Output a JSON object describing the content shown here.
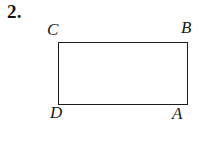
{
  "page": {
    "background_color": "#ffffff",
    "ink_color": "#1a1a1a",
    "width": 215,
    "height": 144
  },
  "problem": {
    "number_label": "2."
  },
  "figure": {
    "kind": "rectangle",
    "stroke_color": "#1c1c1c",
    "fill_color": "#ffffff",
    "stroke_width_px": 1.5,
    "left": 58,
    "top": 42,
    "width": 130,
    "height": 63,
    "vertices": [
      {
        "name": "C",
        "label": "C",
        "position": "top-left",
        "label_x": 47,
        "label_y": 21
      },
      {
        "name": "B",
        "label": "B",
        "position": "top-right",
        "label_x": 181,
        "label_y": 19
      },
      {
        "name": "D",
        "label": "D",
        "position": "bottom-left",
        "label_x": 50,
        "label_y": 104
      },
      {
        "name": "A",
        "label": "A",
        "position": "bottom-right",
        "label_x": 172,
        "label_y": 105
      }
    ]
  }
}
